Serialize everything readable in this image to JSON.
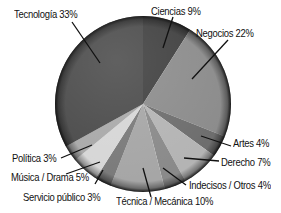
{
  "chart_data": {
    "type": "pie",
    "title": "",
    "categories": [
      "Tecnología",
      "Ciencias",
      "Negocios",
      "Artes",
      "Derecho",
      "Indecisos / Otros",
      "Técnica / Mecánica",
      "Servicio público",
      "Música / Drama",
      "Política"
    ],
    "values": [
      33,
      9,
      22,
      4,
      7,
      4,
      10,
      3,
      5,
      3
    ],
    "unit": "%",
    "labels": [
      "Tecnología 33%",
      "Ciencias 9%",
      "Negocios 22%",
      "Artes 4%",
      "Derecho 7%",
      "Indecisos / Otros 4%",
      "Técnica / Mecánica 10%",
      "Servicio público 3%",
      "Música / Drama 5%",
      "Política 3%"
    ],
    "colors": [
      "#4b4b4b",
      "#404040",
      "#8c8c8c",
      "#6e6e6e",
      "#b4b4b4",
      "#8a8a8a",
      "#a6a6a6",
      "#7a7a7a",
      "#d6d6d6",
      "#a9a9a9"
    ],
    "start_angle_deg": 0,
    "direction": "clockwise",
    "legend_position": "callouts",
    "grid": false
  }
}
